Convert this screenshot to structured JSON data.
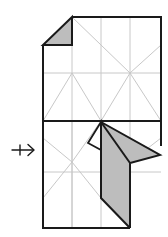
{
  "diagram": {
    "type": "origami-fold-step",
    "colors": {
      "background": "#ffffff",
      "outline": "#1a1a1a",
      "crease": "#c8c8c8",
      "fill_shaded": "#bdbdbd"
    },
    "arrow": {
      "symbol": "push-arrow",
      "direction": "right"
    },
    "sheet": {
      "x": 43,
      "y": 17,
      "width": 118,
      "height": 211,
      "midline_y": 121
    }
  }
}
